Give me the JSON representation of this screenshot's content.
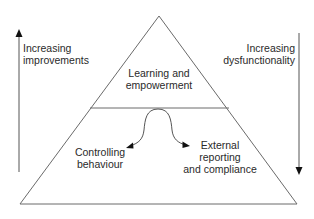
{
  "diagram": {
    "left_axis": {
      "direction": "up",
      "label_lines": [
        "Increasing",
        "improvements"
      ]
    },
    "right_axis": {
      "direction": "down",
      "label_lines": [
        "Increasing",
        "dysfunctionality"
      ]
    },
    "pyramid": {
      "top_section": {
        "label_lines": [
          "Learning and",
          "empowerment"
        ]
      },
      "bottom_section": {
        "left_outcome": {
          "label_lines": [
            "Controlling",
            "behaviour"
          ]
        },
        "right_outcome": {
          "label_lines": [
            "External",
            "reporting",
            "and compliance"
          ]
        }
      }
    },
    "colors": {
      "line": "#555555",
      "text": "#2a2a2a",
      "arrowhead": "#111111"
    }
  }
}
